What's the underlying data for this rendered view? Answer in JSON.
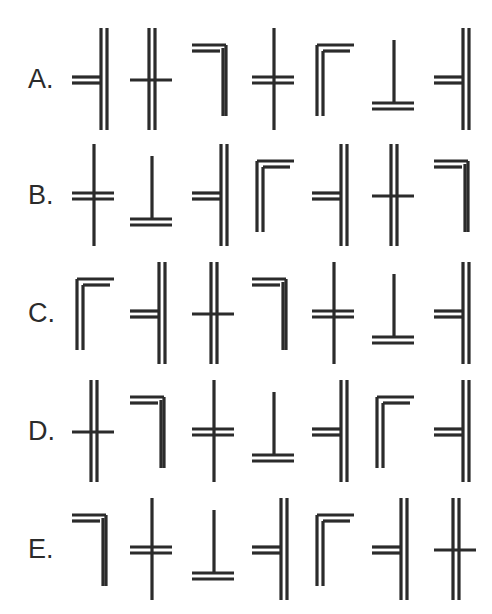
{
  "page": {
    "background_color": "#ffffff",
    "ink_color": "#2b2b2b",
    "kind": "abstract line-glyph sequence puzzle",
    "row_count": 5,
    "glyphs_per_row": 7
  },
  "glyph_legend": {
    "cross-dv-sh": "cross: double vertical stroke, single horizontal stroke",
    "cross-sv-dh": "cross: single vertical stroke, double horizontal stroke",
    "tee-left-dv": "double vertical bar on right with double horizontal arm to the left",
    "corner-tr": "top-right corner: double horizontal top arm to the left, single vertical leg down at right",
    "corner-tl": "top-left corner: double vertical leg at left, double horizontal top arm to the right",
    "tee-up-dh": "tee pointing up: single vertical stem with double horizontal base"
  },
  "rows": [
    {
      "label": "A.",
      "id": "row-a",
      "glyphs": [
        {
          "name": "tee-left-dv",
          "index": 1
        },
        {
          "name": "cross-dv-sh",
          "index": 2
        },
        {
          "name": "corner-tr",
          "index": 3
        },
        {
          "name": "cross-sv-dh",
          "index": 4
        },
        {
          "name": "corner-tl",
          "index": 5
        },
        {
          "name": "tee-up-dh",
          "index": 6
        },
        {
          "name": "tee-left-dv",
          "index": 7
        }
      ]
    },
    {
      "label": "B.",
      "id": "row-b",
      "glyphs": [
        {
          "name": "cross-sv-dh",
          "index": 1
        },
        {
          "name": "tee-up-dh",
          "index": 2
        },
        {
          "name": "tee-left-dv",
          "index": 3
        },
        {
          "name": "corner-tl",
          "index": 4
        },
        {
          "name": "tee-left-dv",
          "index": 5
        },
        {
          "name": "cross-dv-sh",
          "index": 6
        },
        {
          "name": "corner-tr",
          "index": 7
        }
      ]
    },
    {
      "label": "C.",
      "id": "row-c",
      "glyphs": [
        {
          "name": "corner-tl",
          "index": 1
        },
        {
          "name": "tee-left-dv",
          "index": 2
        },
        {
          "name": "cross-dv-sh",
          "index": 3
        },
        {
          "name": "corner-tr",
          "index": 4
        },
        {
          "name": "cross-sv-dh",
          "index": 5
        },
        {
          "name": "tee-up-dh",
          "index": 6
        },
        {
          "name": "tee-left-dv",
          "index": 7
        }
      ]
    },
    {
      "label": "D.",
      "id": "row-d",
      "glyphs": [
        {
          "name": "cross-dv-sh",
          "index": 1
        },
        {
          "name": "corner-tr",
          "index": 2
        },
        {
          "name": "cross-sv-dh",
          "index": 3
        },
        {
          "name": "tee-up-dh",
          "index": 4
        },
        {
          "name": "tee-left-dv",
          "index": 5
        },
        {
          "name": "corner-tl",
          "index": 6
        },
        {
          "name": "tee-left-dv",
          "index": 7
        }
      ]
    },
    {
      "label": "E.",
      "id": "row-e",
      "glyphs": [
        {
          "name": "corner-tr",
          "index": 1
        },
        {
          "name": "cross-sv-dh",
          "index": 2
        },
        {
          "name": "tee-up-dh",
          "index": 3
        },
        {
          "name": "tee-left-dv",
          "index": 4
        },
        {
          "name": "corner-tl",
          "index": 5
        },
        {
          "name": "tee-left-dv",
          "index": 6
        },
        {
          "name": "cross-dv-sh",
          "index": 7
        }
      ]
    }
  ],
  "layout": {
    "row_tops": [
      24,
      140,
      258,
      376,
      494
    ],
    "glyph_x": [
      0,
      58,
      120,
      180,
      240,
      300,
      362
    ]
  }
}
